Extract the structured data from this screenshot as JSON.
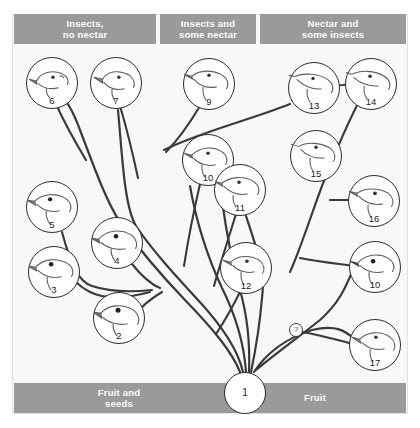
{
  "figure": {
    "background_color": "#f8f8f6",
    "bar_color": "#9a9a9a",
    "bar_text_color": "#ffffff",
    "branch_color": "#3a3a3a"
  },
  "top_categories": [
    {
      "id": "insects-no-nectar",
      "label": "Insects,\nno nectar",
      "x": 14,
      "y": 14,
      "w": 142,
      "h": 30
    },
    {
      "id": "insects-some-nectar",
      "label": "Insects and\nsome nectar",
      "x": 160,
      "y": 14,
      "w": 96,
      "h": 30
    },
    {
      "id": "nectar-some-insects",
      "label": "Nectar and\nsome insects",
      "x": 260,
      "y": 14,
      "w": 146,
      "h": 30
    }
  ],
  "bottom_categories": [
    {
      "id": "fruit-and-seeds",
      "label": "Fruit and\nseeds",
      "x": 14,
      "y": 383,
      "w": 210,
      "h": 30
    },
    {
      "id": "fruit",
      "label": "Fruit",
      "x": 224,
      "y": 383,
      "w": 182,
      "h": 30
    }
  ],
  "nodes": [
    {
      "id": 2,
      "label": "2",
      "cx": 119,
      "cy": 318,
      "r": 26
    },
    {
      "id": 3,
      "label": "3",
      "cx": 54,
      "cy": 272,
      "r": 26
    },
    {
      "id": 4,
      "label": "4",
      "cx": 117,
      "cy": 243,
      "r": 26
    },
    {
      "id": 5,
      "label": "5",
      "cx": 52,
      "cy": 207,
      "r": 26
    },
    {
      "id": 6,
      "label": "6",
      "cx": 52,
      "cy": 83,
      "r": 26
    },
    {
      "id": 7,
      "label": "7",
      "cx": 116,
      "cy": 83,
      "r": 26
    },
    {
      "id": 8,
      "label": "8",
      "cx": 209,
      "cy": 84,
      "r": 26
    },
    {
      "id": 9,
      "label": "9",
      "cx": 314,
      "cy": 88,
      "r": 26
    },
    {
      "id": 13,
      "label": "13",
      "cx": 371,
      "cy": 84,
      "r": 26
    },
    {
      "id": 14,
      "label": "14",
      "cx": 316,
      "cy": 156,
      "r": 26
    },
    {
      "id": 15,
      "label": "15",
      "cx": 374,
      "cy": 201,
      "r": 26
    },
    {
      "id": 16,
      "label": "16",
      "cx": 375,
      "cy": 267,
      "r": 26
    },
    {
      "id": 10,
      "label": "10",
      "cx": 208,
      "cy": 160,
      "r": 26
    },
    {
      "id": 11,
      "label": "11",
      "cx": 240,
      "cy": 190,
      "r": 26
    },
    {
      "id": 12,
      "label": "12",
      "cx": 246,
      "cy": 268,
      "r": 26
    },
    {
      "id": 17,
      "label": "17",
      "cx": 375,
      "cy": 345,
      "r": 26
    }
  ],
  "root_node": {
    "id": 1,
    "label": "1",
    "cx": 245,
    "cy": 393,
    "r": 21
  },
  "unknown_node": {
    "id": "?",
    "label": "?",
    "cx": 296,
    "cy": 330,
    "r": 7
  }
}
